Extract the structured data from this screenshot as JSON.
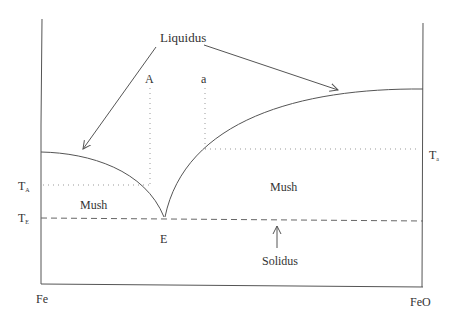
{
  "diagram": {
    "labels": {
      "liquidus": "Liquidus",
      "solidus": "Solidus",
      "mush_left": "Mush",
      "mush_right": "Mush",
      "point_A": "A",
      "point_a": "a",
      "eutectic": "E",
      "fe": "Fe",
      "feo": "FeO",
      "t_A": "T",
      "t_A_sub": "A",
      "t_E": "T",
      "t_E_sub": "E",
      "t_a": "T",
      "t_a_sub": "a"
    },
    "colors": {
      "line": "#555555",
      "dotted": "#888888",
      "text": "#333333"
    }
  }
}
